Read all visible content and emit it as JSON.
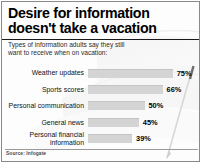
{
  "header": {
    "title": "Desire for information doesn't take a vacation",
    "subtitle": "Types of information adults say they still want to receive when on vacation:"
  },
  "footer": {
    "source": "Source: Infogate"
  },
  "colors": {
    "bar_fill": "#d4d4d4",
    "bar_edge": "#c4c4c4",
    "text": "#000000",
    "rule": "#1a1a1a",
    "background": "#fdfdfd"
  },
  "chart_data": {
    "type": "bar",
    "orientation": "horizontal",
    "title": "Desire for information doesn't take a vacation",
    "subtitle": "Types of information adults say they still want to receive when on vacation:",
    "xlabel": "",
    "ylabel": "",
    "xlim": [
      0,
      100
    ],
    "grid": false,
    "legend": false,
    "value_suffix": "%",
    "categories": [
      "Weather updates",
      "Sports scores",
      "Personal communication",
      "General news",
      "Personal financial information"
    ],
    "values": [
      75,
      66,
      50,
      45,
      39
    ],
    "labels": [
      "75%",
      "66%",
      "50%",
      "45%",
      "39%"
    ],
    "source": "Source: Infogate"
  }
}
